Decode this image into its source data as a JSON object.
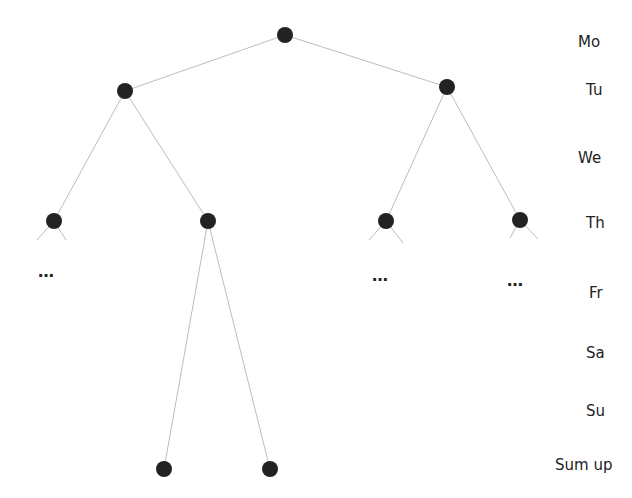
{
  "diagram": {
    "type": "tree",
    "colors": {
      "node": "#222222",
      "edge": "#bbbbbb",
      "text": "#222222"
    },
    "levels": [
      {
        "label": "Mo",
        "y": 43
      },
      {
        "label": "Tu",
        "y": 91
      },
      {
        "label": "We",
        "y": 159
      },
      {
        "label": "Th",
        "y": 224
      },
      {
        "label": "Fr",
        "y": 294
      },
      {
        "label": "Sa",
        "y": 354
      },
      {
        "label": "Su",
        "y": 412
      },
      {
        "label": "Sum up",
        "y": 466
      }
    ],
    "nodes": [
      {
        "id": "mo",
        "x": 285,
        "y": 35
      },
      {
        "id": "tu-left",
        "x": 125,
        "y": 91
      },
      {
        "id": "tu-right",
        "x": 447,
        "y": 87
      },
      {
        "id": "th-1",
        "x": 54,
        "y": 221
      },
      {
        "id": "th-2",
        "x": 208,
        "y": 221
      },
      {
        "id": "th-3",
        "x": 386,
        "y": 221
      },
      {
        "id": "th-4",
        "x": 520,
        "y": 220
      },
      {
        "id": "sum-1",
        "x": 164,
        "y": 469
      },
      {
        "id": "sum-2",
        "x": 270,
        "y": 469
      }
    ],
    "ellipsis": [
      {
        "text": "…",
        "x": 38,
        "y": 270
      },
      {
        "text": "…",
        "x": 372,
        "y": 274
      },
      {
        "text": "…",
        "x": 507,
        "y": 279
      }
    ]
  }
}
